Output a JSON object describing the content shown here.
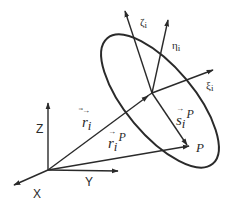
{
  "diagram": {
    "colors": {
      "line": "#2a2a2a",
      "background": "#ffffff"
    },
    "global_frame": {
      "axes": [
        {
          "name": "Z",
          "label": "Z"
        },
        {
          "name": "Y",
          "label": "Y"
        },
        {
          "name": "X",
          "label": "X"
        }
      ]
    },
    "body_frame": {
      "axes": [
        {
          "name": "zeta",
          "label": "ζ",
          "subscript": "i"
        },
        {
          "name": "eta",
          "label": "η",
          "subscript": "i"
        },
        {
          "name": "xi",
          "label": "ξ",
          "subscript": "i"
        }
      ]
    },
    "vectors": {
      "r_i": {
        "symbol": "r",
        "subscript": "i",
        "superscript": ""
      },
      "r_i_P": {
        "symbol": "r",
        "subscript": "i",
        "superscript": "P"
      },
      "s_i_P": {
        "symbol": "s",
        "subscript": "i",
        "superscript": "P"
      }
    },
    "point": {
      "label": "P"
    }
  }
}
